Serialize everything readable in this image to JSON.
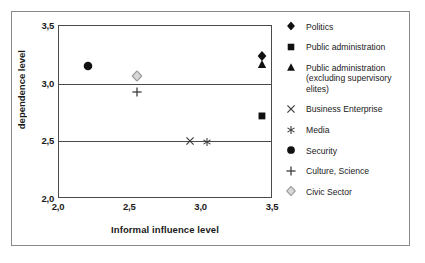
{
  "chart_data": {
    "type": "scatter",
    "title": "",
    "xlabel": "Informal influence level",
    "ylabel": "dependence level",
    "xlim": [
      2.0,
      3.5
    ],
    "ylim": [
      2.0,
      3.5
    ],
    "xticks": [
      "2,0",
      "2,5",
      "3,0",
      "3,5"
    ],
    "xtick_values": [
      2.0,
      2.5,
      3.0,
      3.5
    ],
    "yticks": [
      "2,0",
      "2,5",
      "3,0",
      "3,5"
    ],
    "ytick_values": [
      2.0,
      2.5,
      3.0,
      3.5
    ],
    "grid": "horizontal",
    "gridline_values": [
      2.5,
      3.0
    ],
    "legend_position": "right",
    "decimal_separator": "comma",
    "series": [
      {
        "name": "Politics",
        "marker": "diamond-filled",
        "color": "#111111",
        "x": 3.42,
        "y": 3.24
      },
      {
        "name": "Public administration",
        "marker": "square-filled",
        "color": "#111111",
        "x": 3.42,
        "y": 2.72
      },
      {
        "name": "Public administration (excluding supervisory elites)",
        "marker": "triangle-filled",
        "color": "#111111",
        "x": 3.42,
        "y": 3.17
      },
      {
        "name": "Business Enterprise",
        "marker": "cross",
        "color": "#3d3d3d",
        "x": 2.92,
        "y": 2.5
      },
      {
        "name": "Media",
        "marker": "star",
        "color": "#3d3d3d",
        "x": 3.04,
        "y": 2.49
      },
      {
        "name": "Security",
        "marker": "circle-filled",
        "color": "#111111",
        "x": 2.2,
        "y": 3.15
      },
      {
        "name": "Culture, Science",
        "marker": "plus",
        "color": "#3d3d3d",
        "x": 2.55,
        "y": 2.93
      },
      {
        "name": "Civic Sector",
        "marker": "diamond-open",
        "color": "#9a9a9a",
        "x": 2.55,
        "y": 3.07
      }
    ]
  },
  "legend": {
    "items": [
      {
        "label": "Politics",
        "marker": "diamond-filled"
      },
      {
        "label": "Public administration",
        "marker": "square-filled"
      },
      {
        "label": "Public administration (excluding supervisory elites)",
        "marker": "triangle-filled"
      },
      {
        "label": "Business Enterprise",
        "marker": "cross"
      },
      {
        "label": "Media",
        "marker": "star"
      },
      {
        "label": "Security",
        "marker": "circle-filled"
      },
      {
        "label": "Culture, Science",
        "marker": "plus"
      },
      {
        "label": "Civic Sector",
        "marker": "diamond-open"
      }
    ]
  },
  "axes": {
    "x_title": "Informal influence level",
    "y_title": "dependence level",
    "x_tick_labels": [
      "2,0",
      "2,5",
      "3,0",
      "3,5"
    ],
    "y_tick_labels": [
      "2,0",
      "2,5",
      "3,0",
      "3,5"
    ]
  },
  "colors": {
    "marker_dark": "#111111",
    "marker_mid": "#3d3d3d",
    "marker_light": "#9a9a9a",
    "axis": "#4a4a4a",
    "frame": "#8a8a8a",
    "text": "#1a1a1a",
    "background": "#ffffff"
  }
}
